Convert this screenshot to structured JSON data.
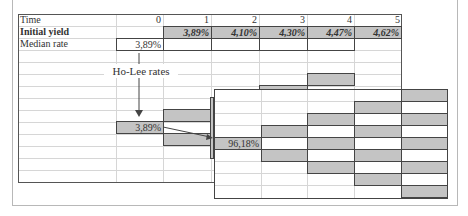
{
  "sheet": {
    "rows": {
      "time_label": "Time",
      "initial_yield_label": "Initial yield",
      "median_rate_label": "Median rate"
    },
    "time_values": [
      "0",
      "1",
      "2",
      "3",
      "4",
      "5"
    ],
    "initial_yields": [
      "3,89%",
      "4,10%",
      "4,30%",
      "4,47%",
      "4,62%"
    ],
    "median_rate_t0": "3,89%",
    "annotation": "Ho-Lee rates",
    "tree_root_value": "3,89%"
  },
  "front_panel": {
    "root_value": "96,18%"
  },
  "colors": {
    "shade": "#c4c4c4",
    "border": "#444444",
    "gridline": "#d6d6d6"
  }
}
